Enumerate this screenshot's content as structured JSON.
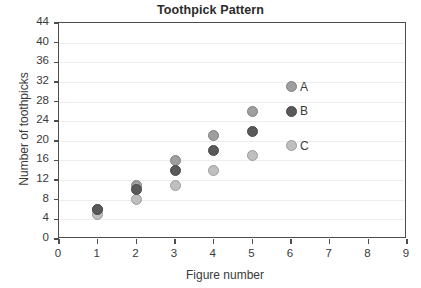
{
  "chart_data": {
    "type": "scatter",
    "title": "Toothpick Pattern",
    "xlabel": "Figure number",
    "ylabel": "Number of toothpicks",
    "xlim": [
      0,
      9
    ],
    "ylim": [
      0,
      44
    ],
    "xticks": [
      0,
      1,
      2,
      3,
      4,
      5,
      6,
      7,
      8,
      9
    ],
    "yticks": [
      0,
      4,
      8,
      12,
      16,
      20,
      24,
      28,
      32,
      36,
      40,
      44
    ],
    "grid": "horizontal",
    "legend_position": "inline-right-of-last-point",
    "x": [
      1,
      2,
      3,
      4,
      5,
      6
    ],
    "series": [
      {
        "name": "A",
        "color": "#9e9e9e",
        "values": [
          6,
          11,
          16,
          21,
          26,
          31
        ]
      },
      {
        "name": "B",
        "color": "#595959",
        "values": [
          6,
          10,
          14,
          18,
          22,
          26
        ]
      },
      {
        "name": "C",
        "color": "#bfbfbf",
        "values": [
          5,
          8,
          11,
          14,
          17,
          19
        ]
      }
    ],
    "annotations": [
      {
        "text": "A",
        "x": 6,
        "y": 31
      },
      {
        "text": "B",
        "x": 6,
        "y": 26
      },
      {
        "text": "C",
        "x": 6,
        "y": 19
      }
    ]
  },
  "colors": {
    "axis": "#4d4d4d",
    "grid": "#ededed",
    "text": "#3a3a3a",
    "title": "#2b2b2b",
    "background": "#ffffff"
  }
}
